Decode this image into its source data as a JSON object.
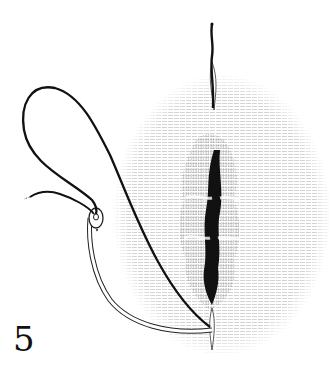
{
  "figure": {
    "number": "5",
    "elements": [
      {
        "name": "curved-needle",
        "description": "curved suture needle with eye at upper end"
      },
      {
        "name": "suture-thread",
        "description": "thread looping from needle eye through wound edge"
      },
      {
        "name": "wound-incision",
        "description": "vertical dark incision with puckered edges"
      },
      {
        "name": "upper-stitch",
        "description": "thread exiting at top stitch point"
      },
      {
        "name": "lower-stitch",
        "description": "needle point entering tissue at bottom"
      }
    ]
  },
  "colors": {
    "ink": "#111111",
    "background": "#ffffff",
    "hatch": "#9a9a9a"
  }
}
